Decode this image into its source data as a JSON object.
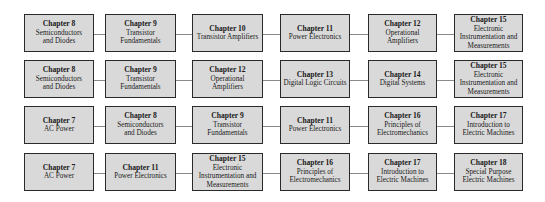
{
  "diagram": {
    "type": "chapter-sequence-flow",
    "rows": [
      {
        "nodes": [
          {
            "chapter": "Chapter 8",
            "title": "Semiconductors\nand Diodes"
          },
          {
            "chapter": "Chapter 9",
            "title": "Transistor\nFundamentals"
          },
          {
            "chapter": "Chapter 10",
            "title": "Transistor Amplifiers"
          },
          {
            "chapter": "Chapter 11",
            "title": "Power Electronics"
          },
          {
            "chapter": "Chapter 12",
            "title": "Operational\nAmplifiers"
          },
          {
            "chapter": "Chapter 15",
            "title": "Electronic\nInstrumentation and\nMeasurements"
          }
        ]
      },
      {
        "nodes": [
          {
            "chapter": "Chapter 8",
            "title": "Semiconductors\nand Diodes"
          },
          {
            "chapter": "Chapter 9",
            "title": "Transistor\nFundamentals"
          },
          {
            "chapter": "Chapter 12",
            "title": "Operational\nAmplifiers"
          },
          {
            "chapter": "Chapter 13",
            "title": "Digital Logic Circuits"
          },
          {
            "chapter": "Chapter 14",
            "title": "Digital Systems"
          },
          {
            "chapter": "Chapter 15",
            "title": "Electronic\nInstrumentation and\nMeasurements"
          }
        ]
      },
      {
        "nodes": [
          {
            "chapter": "Chapter 7",
            "title": "AC Power"
          },
          {
            "chapter": "Chapter 8",
            "title": "Semiconductors\nand Diodes"
          },
          {
            "chapter": "Chapter 9",
            "title": "Transistor\nFundamentals"
          },
          {
            "chapter": "Chapter 11",
            "title": "Power Electronics"
          },
          {
            "chapter": "Chapter 16",
            "title": "Principles of\nElectromechanics"
          },
          {
            "chapter": "Chapter 17",
            "title": "Introduction to\nElectric Machines"
          }
        ]
      },
      {
        "nodes": [
          {
            "chapter": "Chapter 7",
            "title": "AC Power"
          },
          {
            "chapter": "Chapter 11",
            "title": "Power Electronics"
          },
          {
            "chapter": "Chapter 15",
            "title": "Electronic\nInstrumentation and\nMeasurements"
          },
          {
            "chapter": "Chapter 16",
            "title": "Principles of\nElectromechanics"
          },
          {
            "chapter": "Chapter 17",
            "title": "Introduction to\nElectric Machines"
          },
          {
            "chapter": "Chapter 18",
            "title": "Special Purpose\nElectric Machines"
          }
        ]
      }
    ]
  },
  "colors": {
    "box_fill": "#d9d9d9",
    "box_border": "#2a2a2a",
    "connector": "#8a8a8a",
    "background": "#ffffff"
  }
}
